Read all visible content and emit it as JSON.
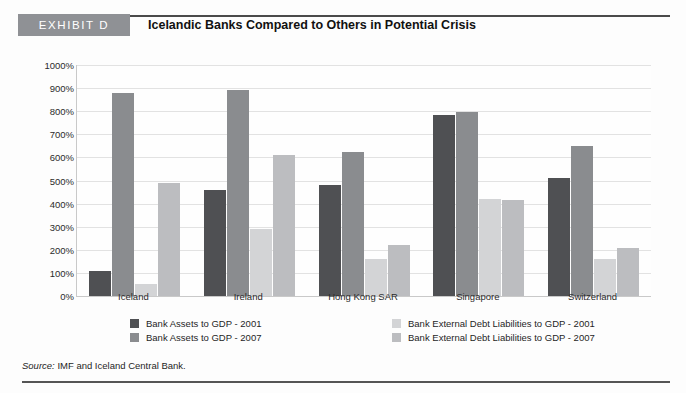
{
  "header": {
    "exhibit_tag": "EXHIBIT D",
    "title": "Icelandic Banks Compared to Others in Potential Crisis"
  },
  "source": {
    "label": "Source:",
    "text": " IMF and Iceland Central Bank."
  },
  "colors": {
    "series_0": "#4f5053",
    "series_1": "#8a8c8f",
    "series_2": "#d3d4d6",
    "series_3": "#bcbdc0",
    "tag_background": "#8f9195",
    "gridline": "#e2e2e2",
    "axis": "#c9c9c9"
  },
  "chart_data": {
    "type": "bar",
    "title": "Icelandic Banks Compared to Others in Potential Crisis",
    "xlabel": "",
    "ylabel": "",
    "ylim": [
      0,
      1000
    ],
    "grid": true,
    "legend_position": "bottom",
    "ytick_labels": [
      "1000%",
      "900%",
      "800%",
      "700%",
      "600%",
      "500%",
      "400%",
      "300%",
      "200%",
      "100%",
      "0%"
    ],
    "ytick_values": [
      1000,
      900,
      800,
      700,
      600,
      500,
      400,
      300,
      200,
      100,
      0
    ],
    "categories": [
      "Iceland",
      "Ireland",
      "Hong Kong SAR",
      "Singapore",
      "Switzerland"
    ],
    "series": [
      {
        "name": "Bank Assets to GDP - 2001",
        "color": "#4f5053",
        "values": [
          110,
          460,
          480,
          785,
          510
        ]
      },
      {
        "name": "Bank Assets to GDP - 2007",
        "color": "#8a8c8f",
        "values": [
          880,
          890,
          625,
          795,
          650
        ]
      },
      {
        "name": "Bank External Debt Liabilities to GDP - 2001",
        "color": "#d3d4d6",
        "values": [
          50,
          290,
          160,
          420,
          160
        ]
      },
      {
        "name": "Bank External Debt Liabilities to GDP - 2007",
        "color": "#bcbdc0",
        "values": [
          490,
          610,
          220,
          415,
          210
        ]
      }
    ]
  }
}
